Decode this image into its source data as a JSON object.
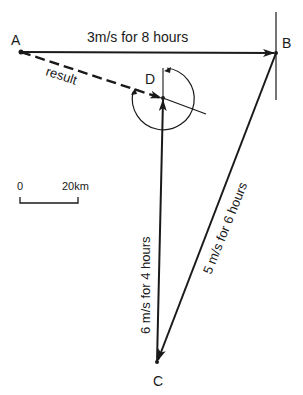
{
  "diagram": {
    "type": "vector-displacement",
    "points": {
      "A": {
        "label": "A"
      },
      "B": {
        "label": "B"
      },
      "C": {
        "label": "C"
      },
      "D": {
        "label": "D"
      }
    },
    "legs": [
      {
        "from": "A",
        "to": "B",
        "label": "3m/s for 8 hours"
      },
      {
        "from": "B",
        "to": "C",
        "label": "5 m/s for 6 hours"
      },
      {
        "from": "C",
        "to": "D",
        "label": "6 m/s for 4 hours"
      }
    ],
    "result": {
      "from": "A",
      "to": "D",
      "label": "result"
    },
    "scale_bar": {
      "start_label": "0",
      "end_label": "20km"
    },
    "colors": {
      "ink": "#1a1a1a",
      "background": "#ffffff"
    }
  }
}
